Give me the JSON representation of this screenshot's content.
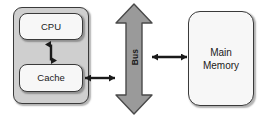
{
  "diagram": {
    "background_color": "#ffffff",
    "stroke_color": "#3a3a3a",
    "container_fill": "#cfcfcf",
    "node_fill": "#f7f7f7",
    "bus_fill": "#9a9a9a",
    "processor_container": {
      "name": "processor-container",
      "label": ""
    },
    "nodes": [
      {
        "id": "cpu",
        "label": "CPU",
        "shape": "rounded-rectangle",
        "fill": "#f7f7f7"
      },
      {
        "id": "cache",
        "label": "Cache",
        "shape": "rounded-rectangle",
        "fill": "#f7f7f7"
      },
      {
        "id": "memory",
        "label": "Main\nMemory",
        "shape": "rounded-rectangle",
        "fill": "#f7f7f7"
      }
    ],
    "bus": {
      "id": "bus",
      "label": "Bus",
      "shape": "vertical-double-arrow",
      "fill": "#9a9a9a",
      "text_rotation_deg": -90
    },
    "connectors": [
      {
        "id": "cpu-cache",
        "from": "cpu",
        "to": "cache",
        "style": "double-arrow",
        "orientation": "vertical"
      },
      {
        "id": "cache-bus",
        "from": "cache",
        "to": "bus",
        "style": "double-arrow",
        "orientation": "horizontal"
      },
      {
        "id": "bus-memory",
        "from": "bus",
        "to": "memory",
        "style": "double-arrow",
        "orientation": "horizontal"
      }
    ]
  }
}
